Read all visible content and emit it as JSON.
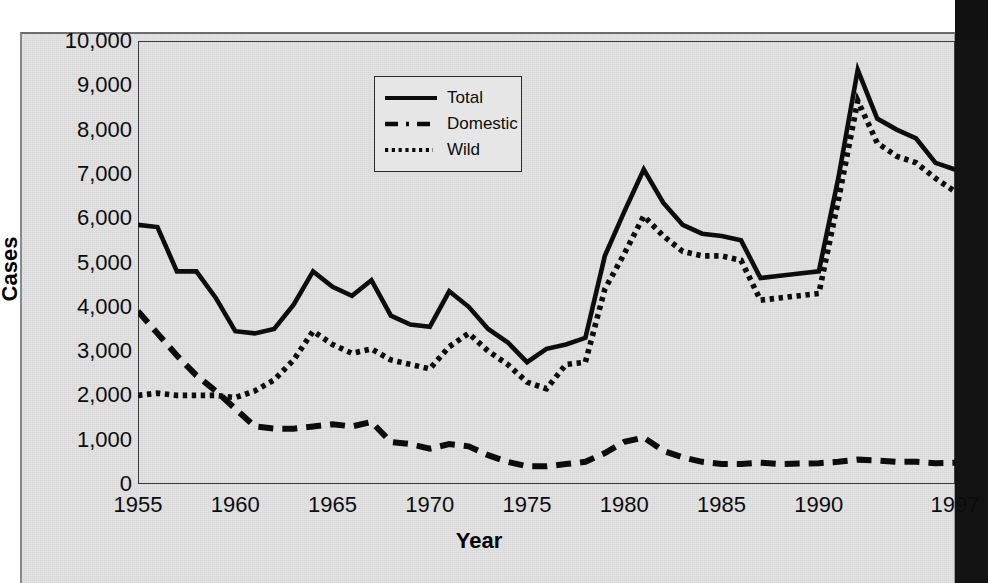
{
  "figure": {
    "axis_titles": {
      "y": "Cases",
      "x": "Year"
    },
    "y_ticks": [
      "0",
      "1,000",
      "2,000",
      "3,000",
      "4,000",
      "5,000",
      "6,000",
      "7,000",
      "8,000",
      "9,000",
      "10,000"
    ],
    "x_ticks": [
      "1955",
      "1960",
      "1965",
      "1970",
      "1975",
      "1980",
      "1985",
      "1990",
      "1997"
    ],
    "legend": [
      {
        "label": "Total",
        "style": "solid"
      },
      {
        "label": "Domestic",
        "style": "dashed"
      },
      {
        "label": "Wild",
        "style": "dotted"
      }
    ],
    "colors": {
      "ink": "#0c0c0c",
      "panel_background": "#e2e2e2",
      "frame": "#3a3a3a",
      "page_edge_dark": "#131313"
    }
  },
  "chart_data": {
    "type": "line",
    "title": "",
    "xlabel": "Year",
    "ylabel": "Cases",
    "xlim": [
      1955,
      1997
    ],
    "ylim": [
      0,
      10000
    ],
    "ytick_values": [
      0,
      1000,
      2000,
      3000,
      4000,
      5000,
      6000,
      7000,
      8000,
      9000,
      10000
    ],
    "xtick_values": [
      1955,
      1960,
      1965,
      1970,
      1975,
      1980,
      1985,
      1990,
      1997
    ],
    "grid": false,
    "legend_position": "upper-center-left",
    "x": [
      1955,
      1956,
      1957,
      1958,
      1959,
      1960,
      1961,
      1962,
      1963,
      1964,
      1965,
      1966,
      1967,
      1968,
      1969,
      1970,
      1971,
      1972,
      1973,
      1974,
      1975,
      1976,
      1977,
      1978,
      1979,
      1980,
      1981,
      1982,
      1983,
      1984,
      1985,
      1986,
      1987,
      1988,
      1989,
      1990,
      1991,
      1992,
      1993,
      1994,
      1995,
      1996,
      1997
    ],
    "series": [
      {
        "name": "Total",
        "style": "solid",
        "values": [
          5850,
          5800,
          4800,
          4800,
          4200,
          3450,
          3400,
          3500,
          4050,
          4800,
          4450,
          4250,
          4600,
          3800,
          3600,
          3550,
          4350,
          4000,
          3500,
          3200,
          2750,
          3050,
          3150,
          3300,
          5150,
          6150,
          7100,
          6350,
          5850,
          5650,
          5600,
          5500,
          4650,
          4700,
          4750,
          4800,
          6900,
          9350,
          8250,
          8000,
          7800,
          7250,
          7100
        ]
      },
      {
        "name": "Domestic",
        "style": "dashed",
        "values": [
          3900,
          3400,
          2900,
          2450,
          2100,
          1700,
          1300,
          1250,
          1250,
          1300,
          1350,
          1300,
          1400,
          950,
          900,
          800,
          900,
          850,
          650,
          500,
          400,
          400,
          450,
          500,
          700,
          950,
          1050,
          750,
          600,
          500,
          450,
          450,
          480,
          450,
          460,
          470,
          500,
          550,
          530,
          500,
          500,
          470,
          480
        ]
      },
      {
        "name": "Wild",
        "style": "dotted",
        "values": [
          2000,
          2050,
          2000,
          2000,
          2000,
          1950,
          2100,
          2350,
          2800,
          3450,
          3150,
          2950,
          3050,
          2800,
          2700,
          2600,
          3100,
          3400,
          3000,
          2700,
          2300,
          2150,
          2700,
          2750,
          4400,
          5200,
          6050,
          5600,
          5250,
          5150,
          5150,
          5050,
          4150,
          4200,
          4250,
          4300,
          6400,
          8650,
          7700,
          7400,
          7250,
          6900,
          6600
        ]
      }
    ]
  }
}
